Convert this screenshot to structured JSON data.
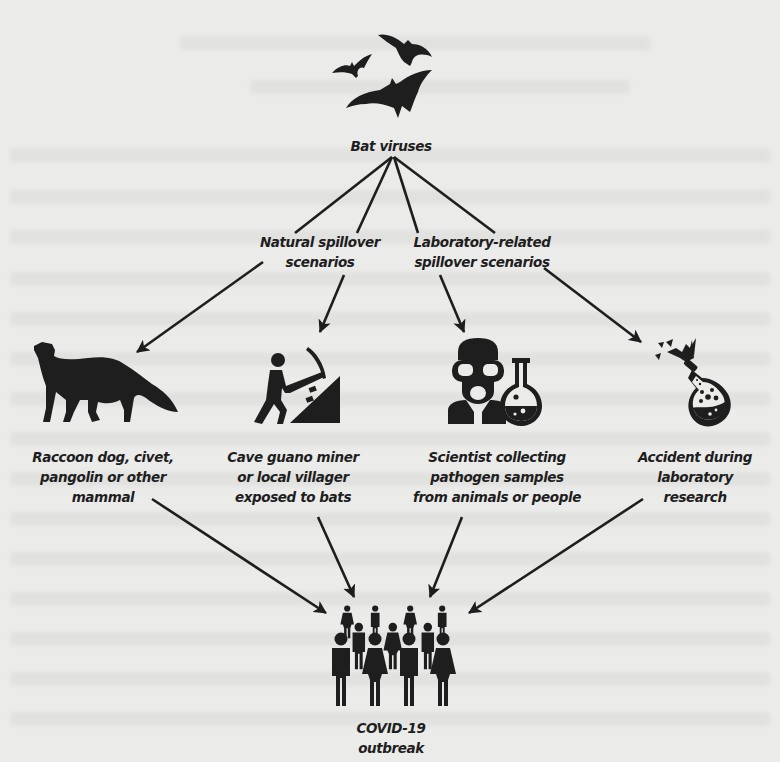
{
  "diagram": {
    "type": "flow-diagram",
    "colors": {
      "background": "#ebebea",
      "ink": "#1e1e1e"
    },
    "source": {
      "id": "bat-viruses",
      "label": "Bat viruses",
      "icon": "bats-icon"
    },
    "branches": [
      {
        "id": "natural",
        "lines": [
          "Natural spillover",
          "scenarios"
        ]
      },
      {
        "id": "laboratory",
        "lines": [
          "Laboratory-related",
          "spillover scenarios"
        ]
      }
    ],
    "scenarios": [
      {
        "id": "animal",
        "icon": "fox-mammal-icon",
        "lines": [
          "Raccoon dog, civet,",
          "pangolin or other",
          "mammal"
        ],
        "branch": "natural"
      },
      {
        "id": "miner",
        "icon": "miner-pickaxe-icon",
        "lines": [
          "Cave guano miner",
          "or local villager",
          "exposed to bats"
        ],
        "branch": "natural"
      },
      {
        "id": "scientist",
        "icon": "scientist-flask-icon",
        "lines": [
          "Scientist collecting",
          "pathogen samples",
          "from animals or people"
        ],
        "branch": "laboratory"
      },
      {
        "id": "accident",
        "icon": "broken-flask-icon",
        "lines": [
          "Accident during",
          "laboratory",
          "research"
        ],
        "branch": "laboratory"
      }
    ],
    "outcome": {
      "id": "covid-outbreak",
      "icon": "crowd-icon",
      "lines": [
        "COVID-19",
        "outbreak"
      ]
    },
    "edges": [
      [
        "bat-viruses",
        "animal"
      ],
      [
        "bat-viruses",
        "miner"
      ],
      [
        "bat-viruses",
        "scientist"
      ],
      [
        "bat-viruses",
        "accident"
      ],
      [
        "animal",
        "covid-outbreak"
      ],
      [
        "miner",
        "covid-outbreak"
      ],
      [
        "scientist",
        "covid-outbreak"
      ],
      [
        "accident",
        "covid-outbreak"
      ]
    ]
  }
}
